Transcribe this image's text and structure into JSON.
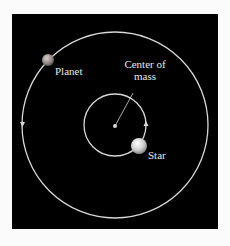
{
  "diagram": {
    "labels": {
      "planet": "Planet",
      "center_line1": "Center of",
      "center_line2": "mass",
      "star": "Star"
    },
    "colors": {
      "background": "#000000",
      "orbit": "#d8d8d8",
      "text": "#e8e8e8",
      "page": "#fbfbfb"
    }
  }
}
